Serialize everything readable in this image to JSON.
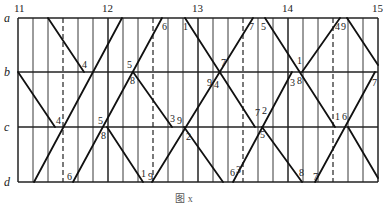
{
  "chart_data": {
    "type": "train-operation-diagram",
    "title": "",
    "caption": "图 x",
    "xlabel": "Time (hour)",
    "ylabel": "Station",
    "hours": [
      "11",
      "12",
      "13",
      "14",
      "15"
    ],
    "minute_grid_interval": 10,
    "dashed_half_hour_lines": true,
    "stations": [
      "a",
      "b",
      "c",
      "d"
    ],
    "station_y": {
      "a": 18,
      "b": 72,
      "c": 127,
      "d": 182
    },
    "x_range_px": [
      18,
      378
    ],
    "train_segments": [
      {
        "id": 1,
        "from": [
          48,
          18
        ],
        "to": [
          84,
          72
        ],
        "direction": "down"
      },
      {
        "id": 2,
        "from": [
          18,
          72
        ],
        "to": [
          55,
          127
        ],
        "direction": "down"
      },
      {
        "id": 3,
        "from": [
          34,
          182
        ],
        "to": [
          122,
          18
        ],
        "direction": "up"
      },
      {
        "id": 4,
        "from": [
          73,
          182
        ],
        "to": [
          162,
          18
        ],
        "direction": "up"
      },
      {
        "id": 5,
        "from": [
          133,
          72
        ],
        "to": [
          172,
          127
        ],
        "direction": "down"
      },
      {
        "id": 6,
        "from": [
          107,
          127
        ],
        "to": [
          143,
          182
        ],
        "direction": "down"
      },
      {
        "id": 7,
        "from": [
          152,
          182
        ],
        "to": [
          253,
          18
        ],
        "direction": "up"
      },
      {
        "id": 8,
        "from": [
          185,
          18
        ],
        "to": [
          255,
          127
        ],
        "direction": "down"
      },
      {
        "id": 9,
        "from": [
          184,
          127
        ],
        "to": [
          223,
          182
        ],
        "direction": "down"
      },
      {
        "id": 10,
        "from": [
          233,
          182
        ],
        "to": [
          292,
          72
        ],
        "direction": "up"
      },
      {
        "id": 11,
        "from": [
          262,
          127
        ],
        "to": [
          302,
          182
        ],
        "direction": "down"
      },
      {
        "id": 12,
        "from": [
          265,
          18
        ],
        "to": [
          335,
          127
        ],
        "direction": "down"
      },
      {
        "id": 13,
        "from": [
          302,
          72
        ],
        "to": [
          340,
          18
        ],
        "direction": "up"
      },
      {
        "id": 14,
        "from": [
          347,
          18
        ],
        "to": [
          378,
          65
        ],
        "direction": "down"
      },
      {
        "id": 15,
        "from": [
          315,
          182
        ],
        "to": [
          375,
          72
        ],
        "direction": "up"
      },
      {
        "id": 16,
        "from": [
          348,
          127
        ],
        "to": [
          378,
          178
        ],
        "direction": "down"
      }
    ],
    "minute_labels": [
      {
        "text": "4",
        "x": 82,
        "y": 68
      },
      {
        "text": "4",
        "x": 56,
        "y": 124
      },
      {
        "text": "6",
        "x": 67,
        "y": 180
      },
      {
        "text": "5",
        "x": 98,
        "y": 124
      },
      {
        "text": "8",
        "x": 101,
        "y": 139
      },
      {
        "text": "5",
        "x": 127,
        "y": 68
      },
      {
        "text": "8",
        "x": 130,
        "y": 84
      },
      {
        "text": "6",
        "x": 162,
        "y": 30
      },
      {
        "text": "3",
        "x": 170,
        "y": 122
      },
      {
        "text": "9",
        "x": 177,
        "y": 124
      },
      {
        "text": "1",
        "x": 141,
        "y": 177
      },
      {
        "text": "9",
        "x": 148,
        "y": 180
      },
      {
        "text": "1",
        "x": 183,
        "y": 30
      },
      {
        "text": "2",
        "x": 186,
        "y": 140
      },
      {
        "text": "7",
        "x": 221,
        "y": 66
      },
      {
        "text": "9",
        "x": 207,
        "y": 86
      },
      {
        "text": "4",
        "x": 214,
        "y": 88
      },
      {
        "text": "7",
        "x": 249,
        "y": 30
      },
      {
        "text": "5",
        "x": 261,
        "y": 30
      },
      {
        "text": "7",
        "x": 255,
        "y": 116
      },
      {
        "text": "2",
        "x": 262,
        "y": 114
      },
      {
        "text": "5",
        "x": 260,
        "y": 138
      },
      {
        "text": "6",
        "x": 230,
        "y": 176
      },
      {
        "text": "3",
        "x": 236,
        "y": 173
      },
      {
        "text": "1",
        "x": 297,
        "y": 64
      },
      {
        "text": "3",
        "x": 290,
        "y": 86
      },
      {
        "text": "8",
        "x": 297,
        "y": 84
      },
      {
        "text": "8",
        "x": 299,
        "y": 176
      },
      {
        "text": "4",
        "x": 335,
        "y": 30
      },
      {
        "text": "9",
        "x": 341,
        "y": 30
      },
      {
        "text": "1",
        "x": 335,
        "y": 120
      },
      {
        "text": "6",
        "x": 342,
        "y": 120
      },
      {
        "text": "7",
        "x": 372,
        "y": 86
      },
      {
        "text": "7",
        "x": 313,
        "y": 180
      }
    ]
  }
}
